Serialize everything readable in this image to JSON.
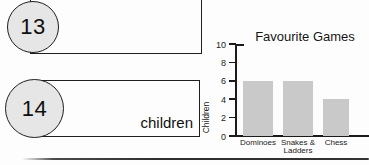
{
  "questions": [
    {
      "number": "13",
      "answer_text": ""
    },
    {
      "number": "14",
      "answer_text": "children"
    }
  ],
  "chart_data": {
    "type": "bar",
    "title": "Favourite Games",
    "ylabel": "Children",
    "xlabel": "",
    "categories": [
      "Dominoes",
      "Snakes &\nLadders",
      "Chess"
    ],
    "values": [
      6,
      6,
      4
    ],
    "yticks": [
      0,
      2,
      4,
      6,
      8,
      10
    ],
    "ylim": [
      0,
      10
    ],
    "grid": "off",
    "legend": "none",
    "bar_color": "#c9c9c9",
    "axis_color": "#1b1b1b"
  },
  "divider": {
    "style": "thick-horizontal-rule"
  }
}
